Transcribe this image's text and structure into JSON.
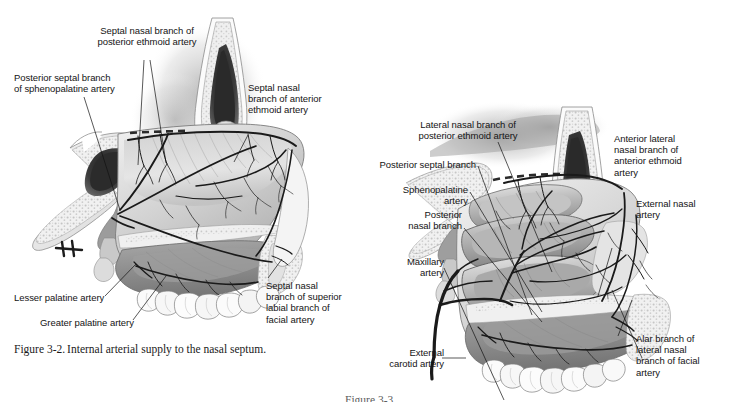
{
  "page": {
    "background": "#ffffff",
    "width": 729,
    "height": 402,
    "ink": "#141414"
  },
  "figure_left": {
    "caption_number": "Figure 3-2.",
    "caption_text": "Internal arterial supply to the nasal septum.",
    "subject": "midsagittal section of nasal septum with arterial supply",
    "labels": [
      {
        "id": "septal-nasal-posterior-ethmoid",
        "text": "Septal nasal branch of\nposterior ethmoid artery",
        "align": "center"
      },
      {
        "id": "posterior-septal-sphenopalatine",
        "text": "Posterior septal branch\nof sphenopalatine artery",
        "align": "left"
      },
      {
        "id": "septal-nasal-anterior-ethmoid",
        "text": "Septal nasal\nbranch of anterior\nethmoid artery",
        "align": "left"
      },
      {
        "id": "lesser-palatine",
        "text": "Lesser palatine artery",
        "align": "left"
      },
      {
        "id": "greater-palatine",
        "text": "Greater palatine artery",
        "align": "left"
      },
      {
        "id": "septal-nasal-superior-labial",
        "text": "Septal nasal\nbranch of superior\nlabial branch of\nfacial artery",
        "align": "left"
      }
    ]
  },
  "figure_right": {
    "caption_number": "Figure 3-3.",
    "caption_text": "",
    "caption_clipped": true,
    "subject": "lateral nasal wall with arterial supply",
    "labels": [
      {
        "id": "lateral-nasal-posterior-ethmoid",
        "text": "Lateral nasal branch of\nposterior ethmoid artery",
        "align": "center"
      },
      {
        "id": "posterior-septal-branch",
        "text": "Posterior septal branch",
        "align": "right"
      },
      {
        "id": "sphenopalatine-artery",
        "text": "Sphenopalatine\nartery",
        "align": "right"
      },
      {
        "id": "posterior-nasal-branch",
        "text": "Posterior\nnasal branch",
        "align": "right"
      },
      {
        "id": "maxillary-artery",
        "text": "Maxillary\nartery",
        "align": "right"
      },
      {
        "id": "external-carotid-artery",
        "text": "External\ncarotid artery",
        "align": "right"
      },
      {
        "id": "anterior-lateral-nasal-anterior-ethmoid",
        "text": "Anterior lateral\nnasal branch of\nanterior ethmoid\nartery",
        "align": "left"
      },
      {
        "id": "external-nasal-artery",
        "text": "External nasal\nartery",
        "align": "left"
      },
      {
        "id": "alar-branch-lateral-nasal-facial",
        "text": "Alar branch of\nlateral nasal\nbranch of facial\nartery",
        "align": "left"
      }
    ]
  }
}
